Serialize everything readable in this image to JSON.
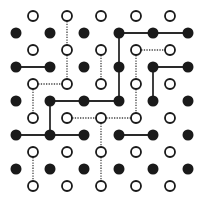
{
  "diagram": {
    "title": "",
    "colors": {
      "background": "#ffffff",
      "filled_dot": "#1a1a1a",
      "open_dot_stroke": "#1a1a1a",
      "solid_edge": "#2a2a2a",
      "dotted_edge": "#444444"
    },
    "filled_dot_grid": {
      "xs": [
        16,
        50,
        84,
        119,
        153,
        188
      ],
      "ys": [
        33,
        67,
        101,
        135,
        169
      ],
      "radius": 5.5
    },
    "open_dot_grid": {
      "xs": [
        33,
        67,
        101,
        136,
        170
      ],
      "ys": [
        16,
        50,
        84,
        118,
        152,
        186
      ],
      "radius": 5
    },
    "solid_edges": [
      [
        [
          119,
          33
        ],
        [
          153,
          33
        ]
      ],
      [
        [
          153,
          33
        ],
        [
          188,
          33
        ]
      ],
      [
        [
          119,
          33
        ],
        [
          119,
          67
        ]
      ],
      [
        [
          119,
          67
        ],
        [
          119,
          101
        ]
      ],
      [
        [
          16,
          67
        ],
        [
          50,
          67
        ]
      ],
      [
        [
          153,
          67
        ],
        [
          188,
          67
        ]
      ],
      [
        [
          153,
          67
        ],
        [
          153,
          101
        ]
      ],
      [
        [
          50,
          101
        ],
        [
          84,
          101
        ]
      ],
      [
        [
          84,
          101
        ],
        [
          119,
          101
        ]
      ],
      [
        [
          50,
          101
        ],
        [
          50,
          135
        ]
      ],
      [
        [
          16,
          135
        ],
        [
          50,
          135
        ]
      ],
      [
        [
          50,
          135
        ],
        [
          84,
          135
        ]
      ],
      [
        [
          119,
          135
        ],
        [
          153,
          135
        ]
      ]
    ],
    "dotted_edges": [
      [
        [
          67,
          16
        ],
        [
          67,
          50
        ]
      ],
      [
        [
          67,
          50
        ],
        [
          67,
          84
        ]
      ],
      [
        [
          33,
          84
        ],
        [
          67,
          84
        ]
      ],
      [
        [
          101,
          50
        ],
        [
          101,
          84
        ]
      ],
      [
        [
          136,
          50
        ],
        [
          170,
          50
        ]
      ],
      [
        [
          136,
          50
        ],
        [
          136,
          84
        ]
      ],
      [
        [
          136,
          84
        ],
        [
          136,
          118
        ]
      ],
      [
        [
          33,
          84
        ],
        [
          33,
          118
        ]
      ],
      [
        [
          67,
          118
        ],
        [
          101,
          118
        ]
      ],
      [
        [
          101,
          118
        ],
        [
          136,
          118
        ]
      ],
      [
        [
          101,
          118
        ],
        [
          101,
          152
        ]
      ],
      [
        [
          101,
          152
        ],
        [
          101,
          186
        ]
      ],
      [
        [
          33,
          152
        ],
        [
          33,
          186
        ]
      ]
    ]
  }
}
